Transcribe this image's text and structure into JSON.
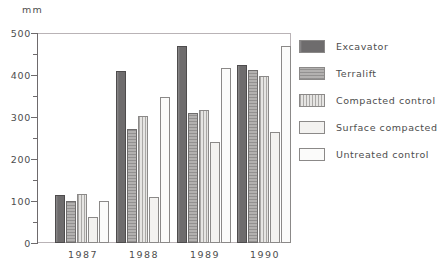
{
  "chart_data": {
    "type": "bar",
    "title": "",
    "subtitle": "",
    "xlabel": "",
    "ylabel": "mm",
    "unit_label": "mm",
    "categories": [
      "1987",
      "1988",
      "1989",
      "1990"
    ],
    "ylim": [
      0,
      500
    ],
    "yticks": [
      0,
      100,
      200,
      300,
      400,
      500
    ],
    "ytick_labels": [
      "0",
      "100",
      "200",
      "300",
      "400",
      "500"
    ],
    "yminor_ticks": [
      50,
      150,
      250,
      350,
      450
    ],
    "grid": false,
    "legend_position": "right",
    "series": [
      {
        "name": "Excavator",
        "pattern": "solid-dark-grey",
        "color": "#6e6c6d",
        "values": [
          115,
          410,
          470,
          425
        ]
      },
      {
        "name": "Terralift",
        "pattern": "medium-grey-hatch",
        "color": "#b3b1b0",
        "values": [
          100,
          272,
          310,
          412
        ]
      },
      {
        "name": "Compacted control",
        "pattern": "light-grey-vertical-lines",
        "color": "#e6e5e3",
        "values": [
          117,
          303,
          317,
          398
        ]
      },
      {
        "name": "Surface compacted",
        "pattern": "fine-dotted",
        "color": "#f3f2f0",
        "values": [
          62,
          110,
          240,
          265
        ]
      },
      {
        "name": "Untreated control",
        "pattern": "sparse-dotted",
        "color": "#fbfbfa",
        "values": [
          100,
          348,
          417,
          470
        ]
      }
    ]
  },
  "legend": {
    "items": [
      {
        "label": "Excavator"
      },
      {
        "label": "Terralift"
      },
      {
        "label": "Compacted control"
      },
      {
        "label": "Surface compacted"
      },
      {
        "label": "Untreated control"
      }
    ]
  }
}
